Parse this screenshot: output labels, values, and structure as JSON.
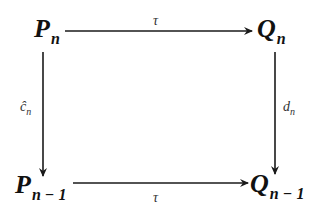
{
  "diagram": {
    "type": "commutative-square",
    "nodes": {
      "top_left": {
        "base": "P",
        "sub": "n"
      },
      "top_right": {
        "base": "Q",
        "sub": "n"
      },
      "bottom_left": {
        "base": "P",
        "sub": "n − 1"
      },
      "bottom_right": {
        "base": "Q",
        "sub": "n − 1"
      }
    },
    "edges": {
      "top": {
        "from": "P_n",
        "to": "Q_n",
        "label": "τ"
      },
      "bottom": {
        "from": "P_{n-1}",
        "to": "Q_{n-1}",
        "label": "τ"
      },
      "left": {
        "from": "P_n",
        "to": "P_{n-1}",
        "label_base": "ĉ",
        "label_sub": "n"
      },
      "right": {
        "from": "Q_n",
        "to": "Q_{n-1}",
        "label_base": "d",
        "label_sub": "n"
      }
    },
    "colors": {
      "stroke": "#1a1a1a",
      "text": "#111111",
      "background": "#ffffff"
    }
  }
}
